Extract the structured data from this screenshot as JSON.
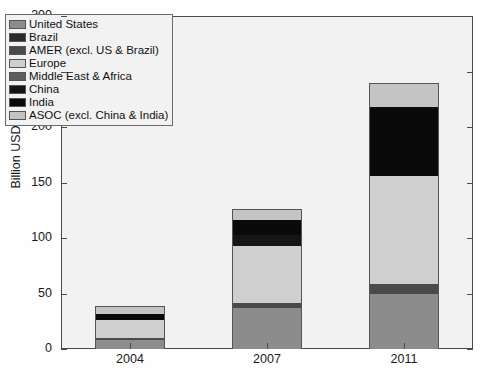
{
  "chart_data": {
    "type": "bar",
    "subtype": "stacked-vertical",
    "title": "",
    "xlabel": "",
    "ylabel": "Billion USD",
    "categories": [
      "2004",
      "2007",
      "2011"
    ],
    "ylim": [
      0,
      300
    ],
    "yticks": [
      0,
      50,
      100,
      150,
      200,
      250,
      300
    ],
    "ytick_labels": [
      "0",
      "50",
      "100",
      "150",
      "200",
      "250",
      "300"
    ],
    "grid": false,
    "legend_position": "upper-left",
    "series": [
      {
        "name": "United States",
        "color": "#8c8c8c",
        "values": [
          8,
          37,
          50
        ]
      },
      {
        "name": "Brazil",
        "color": "#2b2b2b",
        "values": [
          0,
          0,
          0
        ]
      },
      {
        "name": "AMER (excl. US & Brazil)",
        "color": "#4a4a4a",
        "values": [
          2,
          5,
          9
        ]
      },
      {
        "name": "Europe",
        "color": "#cfcfcf",
        "values": [
          17,
          51,
          97
        ]
      },
      {
        "name": "Middle East & Africa",
        "color": "#5e5e5e",
        "values": [
          0,
          0,
          0
        ]
      },
      {
        "name": "China",
        "color": "#151515",
        "values": [
          0,
          10,
          0
        ]
      },
      {
        "name": "India",
        "color": "#0a0a0a",
        "values": [
          5,
          14,
          63
        ]
      },
      {
        "name": "ASOC (excl. China & India)",
        "color": "#c4c4c4",
        "values": [
          7,
          9,
          21
        ]
      }
    ],
    "totals": [
      39,
      131,
      251
    ]
  },
  "axis": {
    "y_title": "Billion USD"
  }
}
